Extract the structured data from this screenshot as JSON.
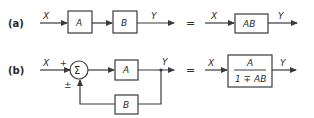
{
  "diagram": {
    "part_a": {
      "label": "(a)",
      "input": "X",
      "blocks": [
        "A",
        "B"
      ],
      "output": "Y",
      "equals": "=",
      "equivalent": {
        "input": "X",
        "block": "AB",
        "output": "Y"
      }
    },
    "part_b": {
      "label": "(b)",
      "input": "X",
      "plus_sign": "+",
      "summer_symbol": "Σ",
      "feedback_sign": "±",
      "forward_block": "A",
      "feedback_block": "B",
      "output": "Y",
      "equals": "=",
      "equivalent": {
        "input": "X",
        "numerator": "A",
        "denominator": "1 ∓ AB",
        "output": "Y"
      }
    }
  },
  "colors": {
    "line": "#3a3a3a",
    "background": "#ffffff"
  }
}
